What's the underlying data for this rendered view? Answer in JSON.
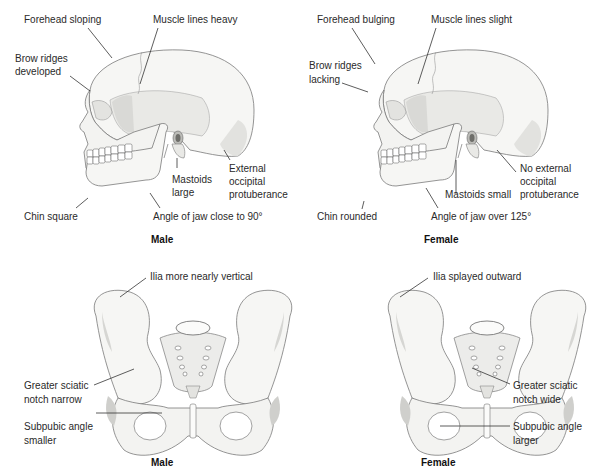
{
  "skulls": {
    "male": {
      "caption": "Male",
      "labels": {
        "forehead": "Forehead sloping",
        "muscle": "Muscle lines heavy",
        "brow_1": "Brow ridges",
        "brow_2": "developed",
        "mastoid_1": "Mastoids",
        "mastoid_2": "large",
        "occipital_1": "External",
        "occipital_2": "occipital",
        "occipital_3": "protuberance",
        "chin": "Chin square",
        "jaw": "Angle of jaw close to 90°"
      }
    },
    "female": {
      "caption": "Female",
      "labels": {
        "forehead": "Forehead bulging",
        "muscle": "Muscle lines slight",
        "brow_1": "Brow ridges",
        "brow_2": "lacking",
        "mastoid": "Mastoids small",
        "occipital_1": "No external",
        "occipital_2": "occipital",
        "occipital_3": "protuberance",
        "chin": "Chin rounded",
        "jaw": "Angle of jaw over 125°"
      }
    }
  },
  "pelves": {
    "male": {
      "caption": "Male",
      "labels": {
        "ilia": "Ilia more nearly vertical",
        "sciatic_1": "Greater sciatic",
        "sciatic_2": "notch narrow",
        "subpubic_1": "Subpubic angle",
        "subpubic_2": "smaller"
      }
    },
    "female": {
      "caption": "Female",
      "labels": {
        "ilia": "Ilia splayed outward",
        "sciatic_1": "Greater sciatic",
        "sciatic_2": "notch wide",
        "subpubic_1": "Subpubic angle",
        "subpubic_2": "larger"
      }
    }
  },
  "colors": {
    "bone": "#f6f6f4",
    "bone_shade": "#d9d9d6",
    "outline": "#7a7a7a",
    "leader": "#333333"
  }
}
